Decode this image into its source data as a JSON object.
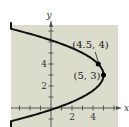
{
  "chart_data": {
    "type": "line",
    "title": "",
    "xlabel": "x",
    "ylabel": "y",
    "xlim": [
      -5,
      6
    ],
    "ylim": [
      -2,
      8
    ],
    "grid": false,
    "x_ticks": [
      2,
      4
    ],
    "y_ticks": [
      2,
      4
    ],
    "x_tick_labels": [
      "2",
      "4"
    ],
    "y_tick_labels": [
      "2",
      "4"
    ],
    "series": [
      {
        "name": "parabola",
        "equation": "x = -0.5(y - 3)^2 + 5",
        "vertex": [
          5,
          3
        ],
        "coefficient": -0.5
      }
    ],
    "points": [
      {
        "label": "(4.5, 4)",
        "x": 4.5,
        "y": 4
      },
      {
        "label": "(5, 3)",
        "x": 5,
        "y": 3
      }
    ],
    "colors": {
      "background": "#dcdccc",
      "curve": "#111111",
      "axis": "#555555"
    }
  }
}
